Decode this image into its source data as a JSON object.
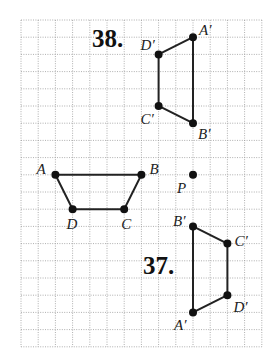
{
  "grid": {
    "origin_px": [
      21,
      20
    ],
    "step_px": 17.2,
    "cols": 14,
    "rows": 19,
    "line_color": "#9a9a9a"
  },
  "figures": [
    {
      "name": "original",
      "vertices": [
        {
          "label": "A",
          "gx": 2,
          "gy": 9,
          "lx": -19,
          "ly": -1
        },
        {
          "label": "B",
          "gx": 7,
          "gy": 9,
          "lx": 8,
          "ly": -1
        },
        {
          "label": "C",
          "gx": 6,
          "gy": 11,
          "lx": -3,
          "ly": 20
        },
        {
          "label": "D",
          "gx": 3,
          "gy": 11,
          "lx": -6,
          "ly": 20
        }
      ]
    },
    {
      "name": "image-38",
      "vertices": [
        {
          "label": "A′",
          "gx": 10,
          "gy": 1,
          "lx": 6,
          "ly": -2
        },
        {
          "label": "B′",
          "gx": 10,
          "gy": 6,
          "lx": 5,
          "ly": 16
        },
        {
          "label": "C′",
          "gx": 8,
          "gy": 5,
          "lx": -18,
          "ly": 18
        },
        {
          "label": "D′",
          "gx": 8,
          "gy": 2,
          "lx": -18,
          "ly": -4
        }
      ]
    },
    {
      "name": "image-37",
      "vertices": [
        {
          "label": "A′",
          "gx": 10,
          "gy": 17,
          "lx": -19,
          "ly": 18
        },
        {
          "label": "B′",
          "gx": 10,
          "gy": 12,
          "lx": -20,
          "ly": 0
        },
        {
          "label": "C′",
          "gx": 12,
          "gy": 13,
          "lx": 7,
          "ly": 2
        },
        {
          "label": "D′",
          "gx": 12,
          "gy": 16,
          "lx": 6,
          "ly": 17
        }
      ]
    }
  ],
  "point_p": {
    "label": "P",
    "gx": 10,
    "gy": 9,
    "lx": -16,
    "ly": 18
  },
  "problem_labels": [
    {
      "text": "38.",
      "x": 92,
      "y": 47
    },
    {
      "text": "37.",
      "x": 143,
      "y": 274
    }
  ]
}
